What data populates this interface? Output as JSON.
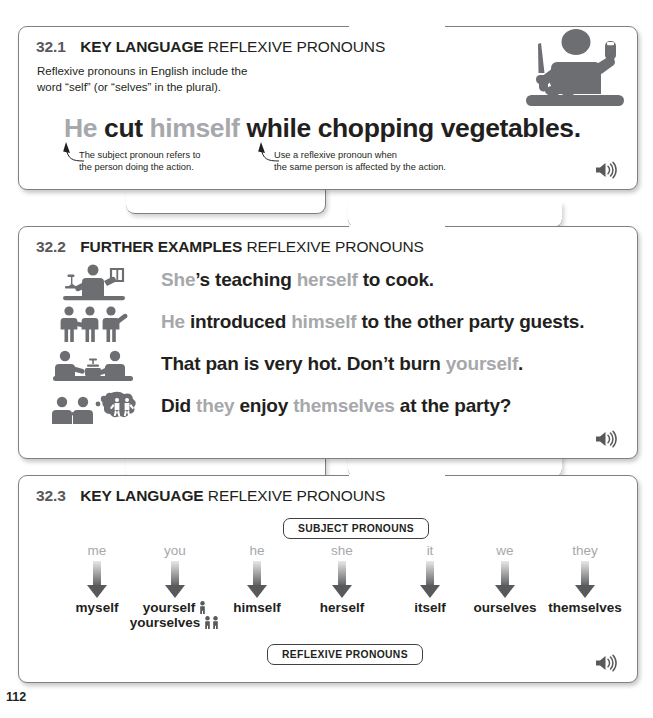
{
  "page": {
    "number": "112"
  },
  "sections": [
    {
      "id": "32.1",
      "number": "32.1",
      "kind": "KEY LANGUAGE",
      "topic": "REFLEXIVE PRONOUNS",
      "intro": "Reflexive pronouns in English include the word “self” (or “selves” in the plural).",
      "headline": [
        {
          "text": "He",
          "style": "gray"
        },
        {
          "text": " cut ",
          "style": "black"
        },
        {
          "text": "himself",
          "style": "gray"
        },
        {
          "text": " while chopping vegetables.",
          "style": "black"
        }
      ],
      "callouts": [
        {
          "line1": "The subject pronoun refers to",
          "line2": "the person doing the action."
        },
        {
          "line1": "Use a reflexive pronoun when",
          "line2": "the same person is affected by the action."
        }
      ],
      "illustration": "chef-cutting-finger-icon",
      "audio": "speaker-icon"
    },
    {
      "id": "32.2",
      "number": "32.2",
      "kind": "FURTHER EXAMPLES",
      "topic": "REFLEXIVE PRONOUNS",
      "examples": [
        {
          "icon": "person-teaching-cooking-icon",
          "parts": [
            {
              "text": "She",
              "style": "gray"
            },
            {
              "text": "’s teaching ",
              "style": "black"
            },
            {
              "text": "herself",
              "style": "gray"
            },
            {
              "text": " to cook.",
              "style": "black"
            }
          ]
        },
        {
          "icon": "three-people-introducing-icon",
          "parts": [
            {
              "text": "He",
              "style": "gray"
            },
            {
              "text": " introduced ",
              "style": "black"
            },
            {
              "text": "himself",
              "style": "gray"
            },
            {
              "text": " to the other party guests.",
              "style": "black"
            }
          ]
        },
        {
          "icon": "hot-pan-on-stove-icon",
          "parts": [
            {
              "text": "That pan is very hot. Don’t burn ",
              "style": "black"
            },
            {
              "text": "yourself",
              "style": "gray"
            },
            {
              "text": ".",
              "style": "black"
            }
          ]
        },
        {
          "icon": "people-thinking-of-party-icon",
          "parts": [
            {
              "text": "Did ",
              "style": "black"
            },
            {
              "text": "they",
              "style": "gray"
            },
            {
              "text": " enjoy ",
              "style": "black"
            },
            {
              "text": "themselves",
              "style": "gray"
            },
            {
              "text": " at the party?",
              "style": "black"
            }
          ]
        }
      ],
      "audio": "speaker-icon"
    },
    {
      "id": "32.3",
      "number": "32.3",
      "kind": "KEY LANGUAGE",
      "topic": "REFLEXIVE PRONOUNS",
      "top_pill": "SUBJECT PRONOUNS",
      "bottom_pill": "REFLEXIVE PRONOUNS",
      "columns": [
        {
          "subject": "me",
          "reflexive": "myself",
          "reflexive2": "",
          "people1": "",
          "people2": ""
        },
        {
          "subject": "you",
          "reflexive": "yourself",
          "reflexive2": "yourselves",
          "people1": "\u0001",
          "people2": "\u0002"
        },
        {
          "subject": "he",
          "reflexive": "himself",
          "reflexive2": "",
          "people1": "",
          "people2": ""
        },
        {
          "subject": "she",
          "reflexive": "herself",
          "reflexive2": "",
          "people1": "",
          "people2": ""
        },
        {
          "subject": "it",
          "reflexive": "itself",
          "reflexive2": "",
          "people1": "",
          "people2": ""
        },
        {
          "subject": "we",
          "reflexive": "ourselves",
          "reflexive2": "",
          "people1": "",
          "people2": ""
        },
        {
          "subject": "they",
          "reflexive": "themselves",
          "reflexive2": "",
          "people1": "",
          "people2": ""
        }
      ],
      "audio": "speaker-icon"
    }
  ],
  "colors": {
    "gray_pronoun": "#a6a8ab",
    "black_text": "#231f20",
    "icon_gray": "#58595b",
    "card_border": "#7f8083"
  }
}
